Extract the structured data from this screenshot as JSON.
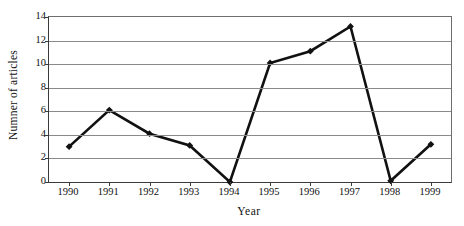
{
  "chart_data": {
    "type": "line",
    "title": "",
    "xlabel": "Year",
    "ylabel": "Numner of articles",
    "categories": [
      "1990",
      "1991",
      "1992",
      "1993",
      "1994",
      "1995",
      "1996",
      "1997",
      "1998",
      "1999"
    ],
    "x": [
      1990,
      1991,
      1992,
      1993,
      1994,
      1995,
      1996,
      1997,
      1998,
      1999
    ],
    "values": [
      3.0,
      6.1,
      4.1,
      3.1,
      0.0,
      10.1,
      11.1,
      13.2,
      0.1,
      3.2
    ],
    "series": [
      {
        "name": "Number of articles",
        "values": [
          3.0,
          6.1,
          4.1,
          3.1,
          0.0,
          10.1,
          11.1,
          13.2,
          0.1,
          3.2
        ]
      }
    ],
    "ylim": [
      0,
      14
    ],
    "y_ticks": [
      0,
      2,
      4,
      6,
      8,
      10,
      12,
      14
    ],
    "y_tick_labels": [
      "0",
      "2",
      "4",
      "6",
      "8",
      "10",
      "12",
      "14"
    ],
    "grid": "horizontal",
    "legend": "none",
    "marker": "diamond",
    "line_color": "#111111",
    "marker_color": "#111111",
    "gridline_color": "#8a8a8a",
    "axis_color": "#3a3a3a",
    "background_color": "#ffffff"
  }
}
